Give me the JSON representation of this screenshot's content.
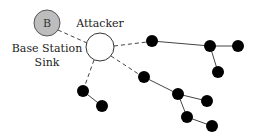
{
  "diagram": {
    "base_station": {
      "letter": "B",
      "label_line1": "Base Station",
      "label_line2": "Sink",
      "fill": "#bdbdbd",
      "cx": 47,
      "cy": 23,
      "r": 13
    },
    "attacker": {
      "label": "Attacker",
      "fill": "#ffffff",
      "cx": 100,
      "cy": 47,
      "r": 14
    },
    "node_color": "#000000",
    "nodes": [
      {
        "id": "n1",
        "cx": 152,
        "cy": 41
      },
      {
        "id": "n2",
        "cx": 210,
        "cy": 46
      },
      {
        "id": "n3",
        "cx": 238,
        "cy": 46
      },
      {
        "id": "n4",
        "cx": 218,
        "cy": 72
      },
      {
        "id": "n5",
        "cx": 144,
        "cy": 77
      },
      {
        "id": "n6",
        "cx": 178,
        "cy": 94
      },
      {
        "id": "n7",
        "cx": 207,
        "cy": 101
      },
      {
        "id": "n8",
        "cx": 187,
        "cy": 117
      },
      {
        "id": "n9",
        "cx": 212,
        "cy": 126
      },
      {
        "id": "n10",
        "cx": 83,
        "cy": 91
      },
      {
        "id": "n11",
        "cx": 102,
        "cy": 106
      }
    ],
    "dashed_links": [
      [
        "base_station",
        "attacker"
      ],
      [
        "attacker",
        "n1"
      ],
      [
        "attacker",
        "n5"
      ],
      [
        "attacker",
        "n10"
      ]
    ],
    "solid_links": [
      [
        "n1",
        "n2"
      ],
      [
        "n2",
        "n3"
      ],
      [
        "n2",
        "n4"
      ],
      [
        "n5",
        "n6"
      ],
      [
        "n6",
        "n7"
      ],
      [
        "n6",
        "n8"
      ],
      [
        "n8",
        "n9"
      ],
      [
        "n10",
        "n11"
      ]
    ]
  }
}
